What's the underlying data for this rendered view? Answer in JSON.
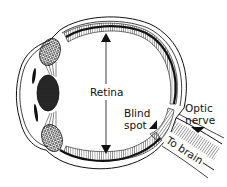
{
  "diagram": {
    "labels": {
      "retina": "Retina",
      "blind_spot_line1": "Blind",
      "blind_spot_line2": "spot",
      "optic_nerve_line1": "Optic",
      "optic_nerve_line2": "nerve",
      "to_brain": "To brain"
    },
    "colors": {
      "ink": "#111111",
      "background": "#ffffff"
    }
  }
}
